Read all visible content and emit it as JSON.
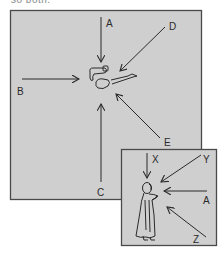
{
  "caption": {
    "text": "so both."
  },
  "main_panel": {
    "fill": "#cfcfcf",
    "border": "#4a4a4a",
    "subject": "top-view-person-pointing",
    "arrows": [
      {
        "label": "A",
        "direction": "from-top"
      },
      {
        "label": "B",
        "direction": "from-left"
      },
      {
        "label": "C",
        "direction": "from-bottom"
      },
      {
        "label": "D",
        "direction": "from-upper-right"
      },
      {
        "label": "E",
        "direction": "from-lower-right"
      }
    ]
  },
  "inset_panel": {
    "fill": "#cfcfcf",
    "border": "#4a4a4a",
    "subject": "side-view-standing-figure",
    "arrows": [
      {
        "label": "X",
        "direction": "from-top"
      },
      {
        "label": "Y",
        "direction": "from-upper-right"
      },
      {
        "label": "A",
        "direction": "from-right"
      },
      {
        "label": "Z",
        "direction": "from-lower-right"
      }
    ]
  }
}
